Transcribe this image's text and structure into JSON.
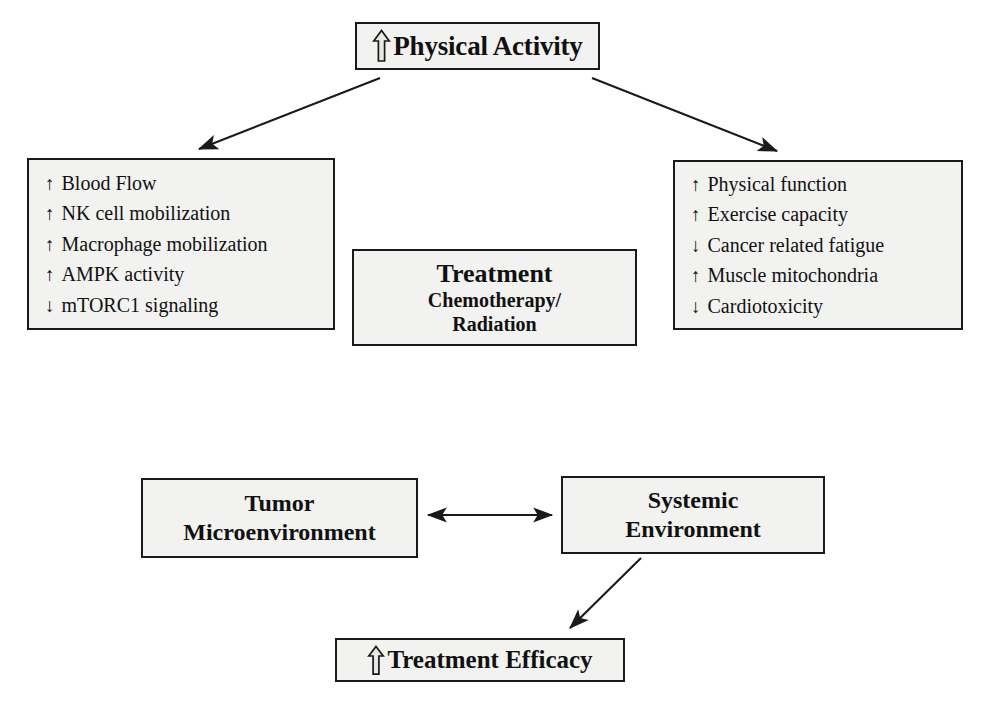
{
  "figure": {
    "type": "flow-diagram",
    "background_color": "#ffffff",
    "box_fill_color": "#f2f2f0",
    "box_border_color": "#1a1a1a",
    "text_color": "#111111"
  },
  "nodes": {
    "physical_activity": {
      "label": "Physical Activity",
      "icon": "up-block-arrow",
      "direction": "increase"
    },
    "local_effects": {
      "items": [
        {
          "arrow": "↑",
          "direction": "increase",
          "label": "Blood Flow"
        },
        {
          "arrow": "↑",
          "direction": "increase",
          "label": "NK cell mobilization"
        },
        {
          "arrow": "↑",
          "direction": "increase",
          "label": "Macrophage mobilization"
        },
        {
          "arrow": "↑",
          "direction": "increase",
          "label": "AMPK activity"
        },
        {
          "arrow": "↓",
          "direction": "decrease",
          "label": "mTORC1 signaling"
        }
      ]
    },
    "systemic_effects": {
      "items": [
        {
          "arrow": "↑",
          "direction": "increase",
          "label": "Physical function"
        },
        {
          "arrow": "↑",
          "direction": "increase",
          "label": "Exercise capacity"
        },
        {
          "arrow": "↓",
          "direction": "decrease",
          "label": "Cancer related fatigue"
        },
        {
          "arrow": "↑",
          "direction": "increase",
          "label": "Muscle mitochondria"
        },
        {
          "arrow": "↓",
          "direction": "decrease",
          "label": "Cardiotoxicity"
        }
      ]
    },
    "treatment": {
      "title": "Treatment",
      "line2": "Chemotherapy/",
      "line3": "Radiation"
    },
    "tumor_microenvironment": {
      "line1": "Tumor",
      "line2": "Microenvironment"
    },
    "systemic_environment": {
      "line1": "Systemic",
      "line2": "Environment"
    },
    "treatment_efficacy": {
      "label": "Treatment Efficacy",
      "icon": "up-block-arrow",
      "direction": "increase"
    }
  },
  "connectors": [
    {
      "name": "physical-activity-to-local-effects",
      "from": "physical_activity",
      "to": "local_effects",
      "style": "single-headed-arrow"
    },
    {
      "name": "physical-activity-to-systemic-effects",
      "from": "physical_activity",
      "to": "systemic_effects",
      "style": "single-headed-arrow"
    },
    {
      "name": "tumor-systemic-bidirectional",
      "from": "tumor_microenvironment",
      "to": "systemic_environment",
      "style": "double-headed-arrow"
    },
    {
      "name": "systemic-environment-to-treatment-efficacy",
      "from": "systemic_environment",
      "to": "treatment_efficacy",
      "style": "single-headed-arrow"
    }
  ]
}
